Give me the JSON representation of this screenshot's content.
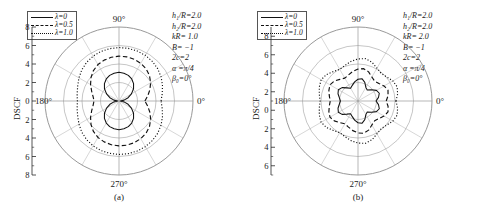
{
  "figure": {
    "axis_label": "DSCF",
    "angle_labels": [
      "90°",
      "0°",
      "270°",
      "180°"
    ]
  },
  "legend": {
    "entries": [
      {
        "label": "λ=0",
        "style": "solid"
      },
      {
        "label": "λ=0.5",
        "style": "dashed"
      },
      {
        "label": "λ=1.0",
        "style": "dotted"
      }
    ]
  },
  "panels": [
    {
      "caption": "(a)",
      "params": [
        "h₁/R=2.0",
        "h₂/R=2.0",
        "kR= 1.0",
        "B= −1",
        "2c=2",
        "α =π/4",
        "β₀=0°"
      ],
      "ticks": [
        "8",
        "6",
        "4",
        "2",
        "0",
        "2",
        "4",
        "6",
        "8"
      ]
    },
    {
      "caption": "(b)",
      "params": [
        "h₁/R=2.0",
        "h₂/R=2.0",
        "kR= 2.0",
        "B= −1",
        "2c=2",
        "α =π/4",
        "β₀=0°"
      ],
      "ticks": [
        "8",
        "6",
        "4",
        "2",
        "0",
        "2",
        "4",
        "6"
      ]
    }
  ],
  "chart_data": {
    "type": "line",
    "plot_kind": "polar",
    "title": "",
    "xlabel": "",
    "ylabel": "DSCF",
    "grid": true,
    "legend_position": "top-left",
    "angle_unit": "degrees",
    "panels": [
      {
        "caption": "(a)",
        "rlim": [
          0,
          8
        ],
        "rticks": [
          0,
          2,
          4,
          6,
          8
        ],
        "angle_ticks": [
          0,
          90,
          180,
          270
        ],
        "parameters": {
          "h1_over_R": 2.0,
          "h2_over_R": 2.0,
          "kR": 1.0,
          "B": -1,
          "2c": 2,
          "alpha": "π/4",
          "beta0": "0°"
        },
        "series": [
          {
            "name": "λ=0",
            "style": "solid",
            "theta": [
              0,
              10,
              20,
              30,
              40,
              50,
              60,
              70,
              80,
              90,
              100,
              110,
              120,
              130,
              140,
              150,
              160,
              170,
              180,
              190,
              200,
              210,
              220,
              230,
              240,
              250,
              260,
              270,
              280,
              290,
              300,
              310,
              320,
              330,
              340,
              350
            ],
            "r": [
              0.15,
              0.55,
              1.05,
              1.55,
              2.05,
              2.45,
              2.75,
              2.95,
              3.05,
              3.1,
              3.05,
              2.95,
              2.75,
              2.45,
              2.05,
              1.55,
              1.05,
              0.55,
              0.15,
              0.55,
              1.05,
              1.55,
              2.05,
              2.45,
              2.75,
              2.95,
              3.05,
              3.1,
              3.05,
              2.95,
              2.75,
              2.45,
              2.05,
              1.55,
              1.05,
              0.55
            ]
          },
          {
            "name": "λ=0.5",
            "style": "dashed",
            "theta": [
              0,
              10,
              20,
              30,
              40,
              50,
              60,
              70,
              80,
              90,
              100,
              110,
              120,
              130,
              140,
              150,
              160,
              170,
              180,
              190,
              200,
              210,
              220,
              230,
              240,
              250,
              260,
              270,
              280,
              290,
              300,
              310,
              320,
              330,
              340,
              350
            ],
            "r": [
              2.8,
              3.15,
              3.55,
              3.95,
              4.3,
              4.55,
              4.7,
              4.8,
              4.85,
              4.85,
              4.8,
              4.7,
              4.55,
              4.3,
              3.95,
              3.55,
              3.15,
              2.85,
              2.7,
              2.85,
              3.15,
              3.55,
              3.95,
              4.3,
              4.55,
              4.7,
              4.8,
              4.85,
              4.85,
              4.8,
              4.7,
              4.55,
              4.3,
              3.95,
              3.55,
              3.15
            ]
          },
          {
            "name": "λ=1.0",
            "style": "dotted",
            "theta": [
              0,
              10,
              20,
              30,
              40,
              50,
              60,
              70,
              80,
              90,
              100,
              110,
              120,
              130,
              140,
              150,
              160,
              170,
              180,
              190,
              200,
              210,
              220,
              230,
              240,
              250,
              260,
              270,
              280,
              290,
              300,
              310,
              320,
              330,
              340,
              350
            ],
            "r": [
              4.55,
              4.75,
              5.0,
              5.25,
              5.45,
              5.6,
              5.7,
              5.75,
              5.78,
              5.78,
              5.75,
              5.7,
              5.6,
              5.45,
              5.25,
              5.0,
              4.75,
              4.6,
              4.5,
              4.6,
              4.75,
              5.0,
              5.25,
              5.45,
              5.6,
              5.7,
              5.75,
              5.78,
              5.78,
              5.75,
              5.7,
              5.6,
              5.45,
              5.25,
              5.0,
              4.75
            ]
          }
        ]
      },
      {
        "caption": "(b)",
        "rlim": [
          0,
          8
        ],
        "rticks": [
          0,
          2,
          4,
          6,
          8
        ],
        "angle_ticks": [
          0,
          90,
          180,
          270
        ],
        "parameters": {
          "h1_over_R": 2.0,
          "h2_over_R": 2.0,
          "kR": 2.0,
          "B": -1,
          "2c": 2,
          "alpha": "π/4",
          "beta0": "0°"
        },
        "series": [
          {
            "name": "λ=0",
            "style": "solid",
            "theta": [
              0,
              10,
              20,
              30,
              40,
              50,
              60,
              70,
              80,
              90,
              100,
              110,
              120,
              130,
              140,
              150,
              160,
              170,
              180,
              190,
              200,
              210,
              220,
              230,
              240,
              250,
              260,
              270,
              280,
              290,
              300,
              310,
              320,
              330,
              340,
              350
            ],
            "r": [
              1.95,
              2.25,
              2.45,
              2.3,
              1.9,
              1.55,
              1.7,
              2.15,
              2.45,
              2.35,
              2.1,
              1.8,
              1.6,
              1.85,
              2.25,
              2.45,
              2.3,
              2.05,
              1.9,
              2.05,
              2.3,
              2.45,
              2.25,
              1.85,
              1.6,
              1.8,
              2.1,
              2.35,
              2.45,
              2.15,
              1.7,
              1.55,
              1.9,
              2.3,
              2.45,
              2.25
            ]
          },
          {
            "name": "λ=0.5",
            "style": "dashed",
            "theta": [
              0,
              10,
              20,
              30,
              40,
              50,
              60,
              70,
              80,
              90,
              100,
              110,
              120,
              130,
              140,
              150,
              160,
              170,
              180,
              190,
              200,
              210,
              220,
              230,
              240,
              250,
              260,
              270,
              280,
              290,
              300,
              310,
              320,
              330,
              340,
              350
            ],
            "r": [
              3.05,
              3.3,
              3.45,
              3.25,
              2.95,
              2.8,
              3.0,
              3.35,
              3.55,
              3.45,
              3.25,
              3.0,
              2.85,
              3.05,
              3.35,
              3.5,
              3.35,
              3.15,
              3.0,
              3.15,
              3.35,
              3.5,
              3.35,
              3.05,
              2.85,
              3.0,
              3.25,
              3.45,
              3.55,
              3.35,
              3.0,
              2.8,
              2.95,
              3.25,
              3.45,
              3.3
            ]
          },
          {
            "name": "λ=1.0",
            "style": "dotted",
            "theta": [
              0,
              10,
              20,
              30,
              40,
              50,
              60,
              70,
              80,
              90,
              100,
              110,
              120,
              130,
              140,
              150,
              160,
              170,
              180,
              190,
              200,
              210,
              220,
              230,
              240,
              250,
              260,
              270,
              280,
              290,
              300,
              310,
              320,
              330,
              340,
              350
            ],
            "r": [
              4.1,
              4.35,
              4.5,
              4.35,
              4.05,
              3.9,
              4.1,
              4.45,
              4.65,
              4.55,
              4.35,
              4.1,
              3.95,
              4.15,
              4.45,
              4.6,
              4.45,
              4.25,
              4.1,
              4.25,
              4.45,
              4.6,
              4.45,
              4.15,
              3.95,
              4.1,
              4.35,
              4.55,
              4.65,
              4.45,
              4.1,
              3.9,
              4.05,
              4.35,
              4.5,
              4.35
            ]
          }
        ]
      }
    ]
  }
}
